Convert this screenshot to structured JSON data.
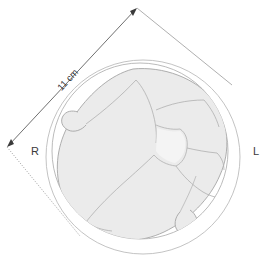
{
  "figure": {
    "dimension": {
      "label": "11 cm",
      "value": 11,
      "unit": "cm",
      "from_point": [
        7,
        147
      ],
      "to_point": [
        137,
        8
      ],
      "arrowheads": "both"
    },
    "orientation_labels": {
      "right": "R",
      "left": "L"
    },
    "colors": {
      "background": "#ffffff",
      "outline_stroke": "#9a9a9a",
      "brain_fill": "#ebebeb",
      "brain_stroke": "#a8a8a8",
      "sulci_stroke": "#b0b0b0",
      "dimension_line": "#6e6e6e",
      "label_text": "#3a3a3a",
      "inner_fill": "#f4f4f4"
    },
    "shapes": {
      "outer_circle": {
        "cx": 143,
        "cy": 155,
        "r": 97
      },
      "inner_circle": {
        "cx": 140,
        "cy": 151,
        "r": 88
      },
      "bounding_square_rotated_deg": -47,
      "tangent_square_vertices": [
        [
          7,
          147
        ],
        [
          137,
          8
        ],
        [
          225,
          78
        ],
        [
          72,
          230
        ]
      ]
    }
  }
}
